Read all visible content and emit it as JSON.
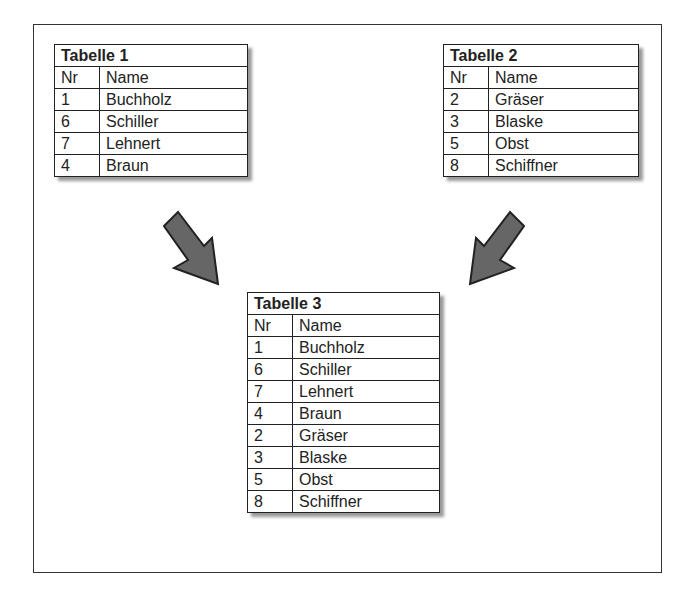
{
  "tables": [
    {
      "title": "Tabelle  1",
      "headers": {
        "nr": "Nr",
        "name": "Name"
      },
      "rows": [
        {
          "nr": "1",
          "name": "Buchholz"
        },
        {
          "nr": "6",
          "name": "Schiller"
        },
        {
          "nr": "7",
          "name": "Lehnert"
        },
        {
          "nr": "4",
          "name": "Braun"
        }
      ]
    },
    {
      "title": "Tabelle  2",
      "headers": {
        "nr": "Nr",
        "name": "Name"
      },
      "rows": [
        {
          "nr": "2",
          "name": "Gräser"
        },
        {
          "nr": "3",
          "name": "Blaske"
        },
        {
          "nr": "5",
          "name": "Obst"
        },
        {
          "nr": "8",
          "name": "Schiffner"
        }
      ]
    },
    {
      "title": "Tabelle  3",
      "headers": {
        "nr": "Nr",
        "name": "Name"
      },
      "rows": [
        {
          "nr": "1",
          "name": "Buchholz"
        },
        {
          "nr": "6",
          "name": "Schiller"
        },
        {
          "nr": "7",
          "name": "Lehnert"
        },
        {
          "nr": "4",
          "name": "Braun"
        },
        {
          "nr": "2",
          "name": "Gräser"
        },
        {
          "nr": "3",
          "name": "Blaske"
        },
        {
          "nr": "5",
          "name": "Obst"
        },
        {
          "nr": "8",
          "name": "Schiffner"
        }
      ]
    }
  ],
  "arrows": [
    {
      "from": "Tabelle 1",
      "to": "Tabelle 3",
      "color": "#666666"
    },
    {
      "from": "Tabelle 2",
      "to": "Tabelle 3",
      "color": "#666666"
    }
  ]
}
